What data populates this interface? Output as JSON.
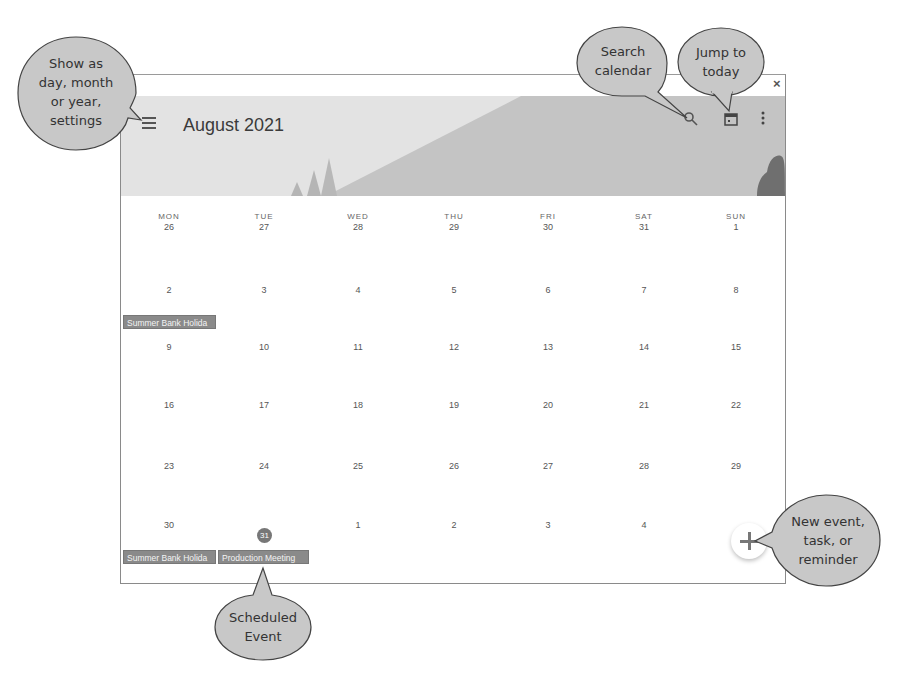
{
  "header": {
    "title": "August 2021",
    "menu_icon": "hamburger-menu-icon",
    "search_icon": "search-icon",
    "today_icon": "calendar-today-icon",
    "more_icon": "more-vert-icon",
    "close_label": "×"
  },
  "weekdays": [
    "MON",
    "TUE",
    "WED",
    "THU",
    "FRI",
    "SAT",
    "SUN"
  ],
  "weeks": [
    [
      "26",
      "27",
      "28",
      "29",
      "30",
      "31",
      "1"
    ],
    [
      "2",
      "3",
      "4",
      "5",
      "6",
      "7",
      "8"
    ],
    [
      "9",
      "10",
      "11",
      "12",
      "13",
      "14",
      "15"
    ],
    [
      "16",
      "17",
      "18",
      "19",
      "20",
      "21",
      "22"
    ],
    [
      "23",
      "24",
      "25",
      "26",
      "27",
      "28",
      "29"
    ],
    [
      "30",
      "31",
      "1",
      "2",
      "3",
      "4",
      "5"
    ]
  ],
  "today": "31",
  "events": [
    {
      "label": "Summer Bank Holida",
      "day": "2"
    },
    {
      "label": "Summer Bank Holida",
      "day": "30"
    },
    {
      "label": "Production Meeting",
      "day": "31"
    }
  ],
  "fab_label": "+",
  "callouts": {
    "menu": "Show as day, month or year, settings",
    "search": "Search calendar",
    "today": "Jump to today",
    "fab": "New event, task, or reminder",
    "event": "Scheduled Event"
  },
  "callout_lines": {
    "menu": [
      "Show as",
      "day, month",
      "or year,",
      "settings"
    ],
    "search": [
      "Search",
      "calendar"
    ],
    "today": [
      "Jump to",
      "today"
    ],
    "fab": [
      "New event,",
      "task,  or",
      "reminder"
    ],
    "event": [
      "Scheduled",
      "Event"
    ]
  },
  "colors": {
    "banner": "#e3e3e3",
    "mountain": "#c4c4c4",
    "tree": "#b0b0b0",
    "bush": "#6f6f6f",
    "event_bg": "#8a8a8a",
    "callout_fill": "#c8c8c8"
  }
}
